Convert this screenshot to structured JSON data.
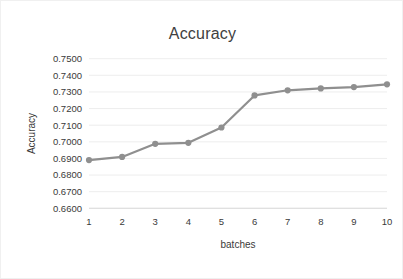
{
  "chart_data": {
    "type": "line",
    "title": "Accuracy",
    "xlabel": "batches",
    "ylabel": "Accuracy",
    "categories": [
      "1",
      "2",
      "3",
      "4",
      "5",
      "6",
      "7",
      "8",
      "9",
      "10"
    ],
    "x": [
      1,
      2,
      3,
      4,
      5,
      6,
      7,
      8,
      9,
      10
    ],
    "values": [
      0.689,
      0.6909,
      0.6988,
      0.6994,
      0.7086,
      0.7279,
      0.731,
      0.7321,
      0.7329,
      0.7346
    ],
    "series": [
      {
        "name": "Accuracy",
        "values": [
          0.689,
          0.6909,
          0.6988,
          0.6994,
          0.7086,
          0.7279,
          0.731,
          0.7321,
          0.7329,
          0.7346
        ]
      }
    ],
    "ylim": [
      0.66,
      0.75
    ],
    "xlim": [
      1,
      10
    ],
    "ytick_labels": [
      "0.7500",
      "0.7400",
      "0.7300",
      "0.7200",
      "0.7100",
      "0.7000",
      "0.6900",
      "0.6800",
      "0.6700",
      "0.6600"
    ],
    "ytick_values": [
      0.75,
      0.74,
      0.73,
      0.72,
      0.71,
      0.7,
      0.69,
      0.68,
      0.67,
      0.66
    ],
    "xtick_labels": [
      "1",
      "2",
      "3",
      "4",
      "5",
      "6",
      "7",
      "8",
      "9",
      "10"
    ],
    "grid": true,
    "grid_axis": "y",
    "legend": false,
    "legend_position": "none",
    "marker": "circle",
    "colors": {
      "series": "#8f8f8f",
      "grid": "#e8e8e8",
      "axis": "#d9d9d9",
      "text": "#3a3a3a",
      "title": "#404040",
      "background": "#ffffff"
    }
  }
}
